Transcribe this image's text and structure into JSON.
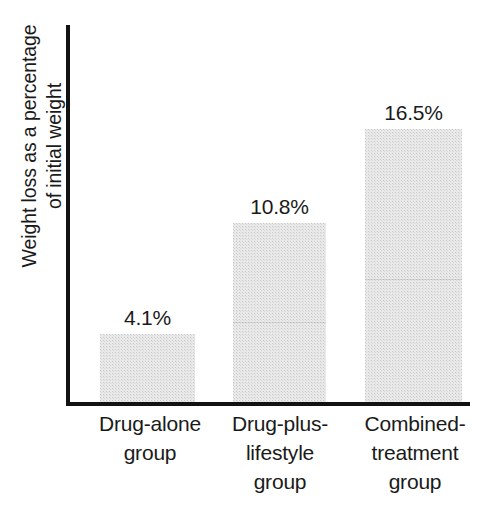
{
  "chart_data": {
    "type": "bar",
    "title": "",
    "subtitle": "",
    "xlabel": "",
    "ylabel": "Weight loss as a percentage of initial weight",
    "ylabel_lines": [
      "Weight loss as a percentage",
      "of initial weight"
    ],
    "categories": [
      "Drug-alone group",
      "Drug-plus-lifestyle group",
      "Combined-treatment group"
    ],
    "category_lines": [
      [
        "Drug-alone",
        "group"
      ],
      [
        "Drug-plus-",
        "lifestyle",
        "group"
      ],
      [
        "Combined-",
        "treatment",
        "group"
      ]
    ],
    "values": [
      4.1,
      10.8,
      16.5
    ],
    "value_labels": [
      "4.1%",
      "10.8%",
      "16.5%"
    ],
    "unit": "%",
    "ylim": [
      0,
      22.8
    ],
    "grid": false,
    "legend": null,
    "axis_ticks": [],
    "colors": {
      "bar_fill": "#e9e9e9",
      "axis_line": "#121212",
      "text": "#1a1a1a",
      "background": "#ffffff"
    }
  }
}
